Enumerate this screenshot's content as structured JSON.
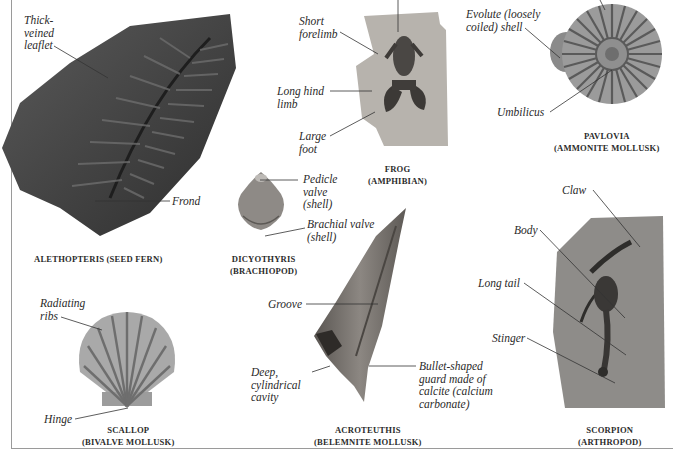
{
  "specimens": [
    {
      "id": "alethopteris",
      "caption": "ALETHOPTERIS (SEED FERN)",
      "labels": [
        "Thick-\nveined\nleaflet",
        "Frond"
      ]
    },
    {
      "id": "frog",
      "caption": "FROG\n(AMPHIBIAN)",
      "labels": [
        "Short\nforelimb",
        "Long hind\nlimb",
        "Large\nfoot"
      ]
    },
    {
      "id": "pavlovia",
      "caption": "PAVLOVIA\n(AMMONITE MOLLUSK)",
      "labels": [
        "Evolute (loosely\ncoiled) shell",
        "Umbilicus"
      ]
    },
    {
      "id": "dicyothyris",
      "caption": "DICYOTHYRIS\n(BRACHIOPOD)",
      "labels": [
        "Pedicle\nvalve\n(shell)",
        "Brachial valve\n(shell)"
      ]
    },
    {
      "id": "acroteuthis",
      "caption": "ACROTEUTHIS\n(BELEMNITE MOLLUSK)",
      "labels": [
        "Groove",
        "Deep,\ncylindrical\ncavity",
        "Bullet-shaped\nguard made of\ncalcite (calcium\ncarbonate)"
      ]
    },
    {
      "id": "scallop",
      "caption": "SCALLOP\n(BIVALVE MOLLUSK)",
      "labels": [
        "Radiating\nribs",
        "Hinge"
      ]
    },
    {
      "id": "scorpion",
      "caption": "SCORPION\n(ARTHROPOD)",
      "labels": [
        "Claw",
        "Body",
        "Long tail",
        "Stinger"
      ]
    }
  ],
  "colors": {
    "rule": "#9a9a9a",
    "text": "#2a2a2a",
    "fossil_dark": "#3a3a3a",
    "fossil_mid": "#7a7a7a",
    "fossil_light": "#b9b9b9"
  }
}
